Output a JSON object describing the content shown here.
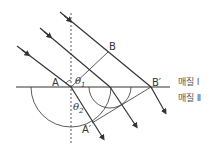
{
  "diagram": {
    "type": "refraction-wavefront",
    "labels": {
      "A": "A",
      "B": "B",
      "B_prime": "B′",
      "A_prime": "A′",
      "theta1": "θ",
      "theta1_sub": "1",
      "theta2": "θ",
      "theta2_sub": "2",
      "medium1": "매질 Ⅰ",
      "medium2": "매질 Ⅱ"
    },
    "colors": {
      "line": "#333333",
      "background": "#ffffff"
    }
  }
}
